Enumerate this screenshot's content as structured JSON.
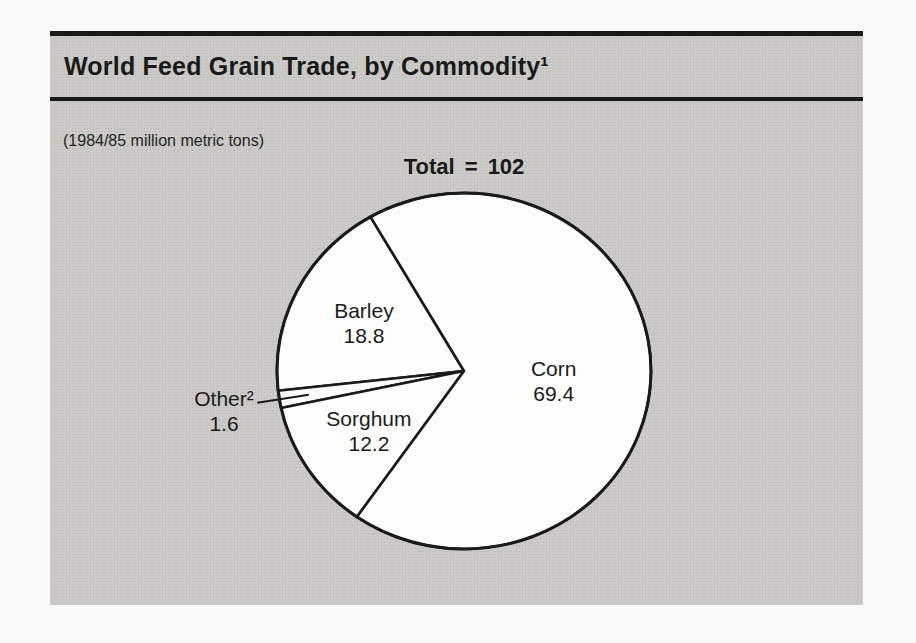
{
  "theme": {
    "page_bg": "#fbfbf9",
    "panel_bg": "#cbcac7",
    "panel_halftone_dot": "#b9b8b5",
    "ink": "#1a1a1a",
    "pie_fill": "#fdfdfc"
  },
  "header": {
    "title": "World Feed Grain Trade, by Commodity¹"
  },
  "subtitle": "(1984/85 million metric tons)",
  "chart_data": {
    "type": "pie",
    "title": "World Feed Grain Trade, by Commodity¹",
    "unit_note": "(1984/85 million metric tons)",
    "total_label": "Total = 102",
    "total": 102,
    "slices": [
      {
        "label": "Barley",
        "value": 18.8,
        "display_value": "18.8"
      },
      {
        "label": "Other²",
        "value": 1.6,
        "display_value": "1.6"
      },
      {
        "label": "Sorghum",
        "value": 12.2,
        "display_value": "12.2"
      },
      {
        "label": "Corn",
        "value": 69.4,
        "display_value": "69.4"
      }
    ],
    "legend": "labels-on-slices",
    "layout": {
      "start_angle_deg": 120,
      "direction": "ccw",
      "cx": 464,
      "cy": 371,
      "rx": 187,
      "ry": 178,
      "slice_fill": "#fdfdfc",
      "stroke": "#1b1b19",
      "stroke_width": 2.6,
      "outline_stroke_width": 3,
      "line_gap_px": 25,
      "baseline_shift_px": 7.5,
      "label_radius_factors": {
        "Barley": 0.6,
        "Other²": 1.3,
        "Sorghum": 0.61,
        "Corn": 0.48
      },
      "label_dy": {
        "Corn": 6,
        "Other²": 3
      },
      "outside_labels": [
        "Other²"
      ],
      "leader": {
        "from_r": 1.12,
        "to_r": 0.84,
        "stroke_width": 2
      }
    }
  }
}
